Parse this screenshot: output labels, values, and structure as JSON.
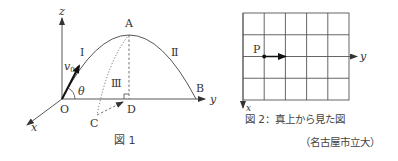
{
  "figure1": {
    "caption": "図 1",
    "axes": {
      "x": "x",
      "y": "y",
      "z": "z"
    },
    "points": {
      "O": "O",
      "A": "A",
      "B": "B",
      "C": "C",
      "D": "D"
    },
    "velocity_label": "v",
    "velocity_subscript": "0",
    "angle_label": "θ",
    "path_labels": {
      "I": "Ⅰ",
      "II": "Ⅱ",
      "III": "Ⅲ"
    }
  },
  "figure2": {
    "caption": "図 2：真上から見た図",
    "point_label": "P",
    "axes": {
      "x": "x",
      "y": "y"
    },
    "grid": {
      "columns": 5,
      "rows": 4
    }
  },
  "source": "（名古屋市立大）",
  "colors": {
    "line": "#444444",
    "text": "#333333",
    "grid": "#555555"
  }
}
